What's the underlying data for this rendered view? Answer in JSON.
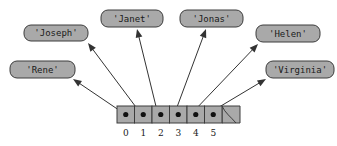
{
  "diagram": {
    "colors": {
      "box_fill": "#a9a9a9",
      "box_stroke": "#3c3c3c",
      "cell_fill": "#a9a9a9",
      "cell_stroke": "#3c3c3c",
      "dot": "#111111",
      "arrow": "#333333",
      "text": "#1a1a1a",
      "background": "#ffffff"
    },
    "array": {
      "name": "list-cells",
      "x": 117,
      "y": 106,
      "cell_width": 17.5,
      "height": 17,
      "tail_width": 18,
      "has_ragged_tail": true,
      "cells": [
        {
          "index": "0",
          "value": "'Rene'"
        },
        {
          "index": "1",
          "value": "'Joseph'"
        },
        {
          "index": "2",
          "value": "'Janet'"
        },
        {
          "index": "3",
          "value": "'Jonas'"
        },
        {
          "index": "4",
          "value": "'Helen'"
        },
        {
          "index": "5",
          "value": "'Virginia'"
        }
      ]
    },
    "value_boxes": [
      {
        "name": "value-box-joseph",
        "label": "'Joseph'",
        "x": 24,
        "y": 25,
        "width": 64,
        "height": 16,
        "rx": 7
      },
      {
        "name": "value-box-rene",
        "label": "'Rene'",
        "x": 10,
        "y": 61,
        "width": 65,
        "height": 17,
        "rx": 7
      },
      {
        "name": "value-box-janet",
        "label": "'Janet'",
        "x": 101,
        "y": 10,
        "width": 62,
        "height": 17,
        "rx": 7
      },
      {
        "name": "value-box-jonas",
        "label": "'Jonas'",
        "x": 180,
        "y": 10,
        "width": 63,
        "height": 17,
        "rx": 7
      },
      {
        "name": "value-box-helen",
        "label": "'Helen'",
        "x": 256,
        "y": 25,
        "width": 64,
        "height": 17,
        "rx": 7
      },
      {
        "name": "value-box-virginia",
        "label": "'Virginia'",
        "x": 266,
        "y": 61,
        "width": 68,
        "height": 17,
        "rx": 7
      }
    ],
    "arrows": [
      {
        "name": "arrow-cell-0-to-rene",
        "x1": 122.5,
        "y1": 112.5,
        "x2": 73,
        "y2": 79
      },
      {
        "name": "arrow-cell-1-to-joseph",
        "x1": 140.0,
        "y1": 112.5,
        "x2": 88,
        "y2": 43
      },
      {
        "name": "arrow-cell-2-to-janet",
        "x1": 157.5,
        "y1": 112.5,
        "x2": 137,
        "y2": 29
      },
      {
        "name": "arrow-cell-3-to-jonas",
        "x1": 175.0,
        "y1": 112.5,
        "x2": 206,
        "y2": 29
      },
      {
        "name": "arrow-cell-4-to-helen",
        "x1": 192.5,
        "y1": 112.5,
        "x2": 258,
        "y2": 44
      },
      {
        "name": "arrow-cell-5-to-virginia",
        "x1": 210.0,
        "y1": 112.5,
        "x2": 266,
        "y2": 79
      }
    ]
  }
}
